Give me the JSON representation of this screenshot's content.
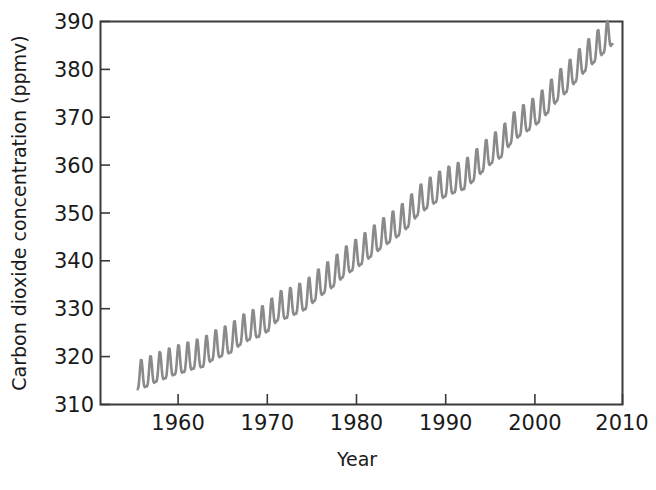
{
  "chart_data": {
    "type": "line",
    "title": "",
    "subtitle": "",
    "xlabel": "Year",
    "ylabel": "Carbon dioxide concentration (ppmv)",
    "xlim": [
      1954,
      2010
    ],
    "ylim": [
      310,
      390
    ],
    "x_ticks": [
      1960,
      1970,
      1980,
      1990,
      2000,
      2010
    ],
    "x_tick_labels": [
      "1960",
      "1970",
      "1980",
      "1990",
      "2000",
      "2010"
    ],
    "y_ticks": [
      310,
      320,
      330,
      340,
      350,
      360,
      370,
      380,
      390
    ],
    "y_tick_labels": [
      "310",
      "320",
      "330",
      "340",
      "350",
      "360",
      "370",
      "380",
      "390"
    ],
    "grid": false,
    "legend": null,
    "legend_position": "none",
    "line_color": "#8a8a8a",
    "axis_color": "#3a3a3a",
    "background_color": "#ffffff",
    "annotations": [],
    "series": [
      {
        "name": "Atmospheric CO2 (monthly mean, Mauna Loa)",
        "description": "Rising annual trend with superimposed seasonal sawtooth oscillation of about +/- 3 ppmv; maxima in May, minima in September/October.",
        "seasonal_amplitude_ppmv": 3.0,
        "x": [
          1958,
          1959,
          1960,
          1961,
          1962,
          1963,
          1964,
          1965,
          1966,
          1967,
          1968,
          1969,
          1970,
          1971,
          1972,
          1973,
          1974,
          1975,
          1976,
          1977,
          1978,
          1979,
          1980,
          1981,
          1982,
          1983,
          1984,
          1985,
          1986,
          1987,
          1988,
          1989,
          1990,
          1991,
          1992,
          1993,
          1994,
          1995,
          1996,
          1997,
          1998,
          1999,
          2000,
          2001,
          2002,
          2003,
          2004,
          2005,
          2006,
          2007,
          2008
        ],
        "values": [
          315.3,
          315.9,
          316.9,
          317.6,
          318.4,
          318.9,
          319.6,
          320.0,
          321.4,
          322.2,
          323.0,
          324.6,
          325.7,
          326.3,
          327.5,
          329.7,
          330.2,
          331.1,
          332.0,
          333.8,
          335.4,
          336.8,
          338.7,
          340.1,
          341.4,
          343.0,
          344.6,
          346.0,
          347.4,
          349.2,
          351.6,
          353.1,
          354.4,
          355.6,
          356.4,
          357.1,
          358.8,
          360.8,
          362.6,
          363.8,
          366.6,
          368.3,
          369.5,
          371.0,
          373.1,
          375.6,
          377.4,
          379.6,
          381.8,
          383.7,
          385.6
        ],
        "first_point": {
          "year": 1958,
          "value": 315.3
        },
        "last_point": {
          "year": 2008,
          "value": 385.6
        },
        "y_min_visible": 313.0,
        "y_max_visible": 388.0
      }
    ]
  },
  "figure": {
    "caption": "",
    "axis_title_x": "Year",
    "axis_title_y": "Carbon dioxide concentration (ppmv)"
  }
}
